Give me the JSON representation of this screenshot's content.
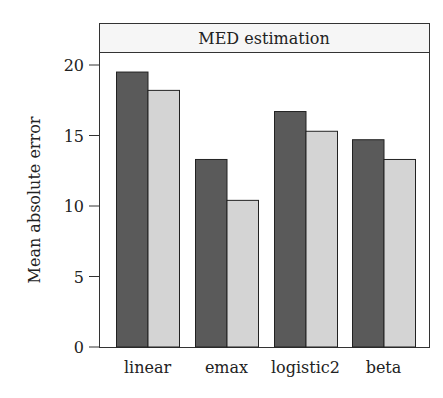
{
  "chart_data": {
    "type": "bar",
    "title": "MED estimation",
    "xlabel": "",
    "ylabel": "Mean absolute error",
    "categories": [
      "linear",
      "emax",
      "logistic2",
      "beta"
    ],
    "series": [
      {
        "name": "series 1",
        "color": "#5a5a5a",
        "values": [
          19.5,
          13.3,
          16.7,
          14.7
        ]
      },
      {
        "name": "series 2",
        "color": "#d4d4d4",
        "values": [
          18.2,
          10.4,
          15.3,
          13.3
        ]
      }
    ],
    "yticks": [
      "0",
      "5",
      "10",
      "15",
      "20"
    ],
    "ylim": [
      0,
      20.7
    ],
    "grid": false,
    "legend": "none"
  }
}
